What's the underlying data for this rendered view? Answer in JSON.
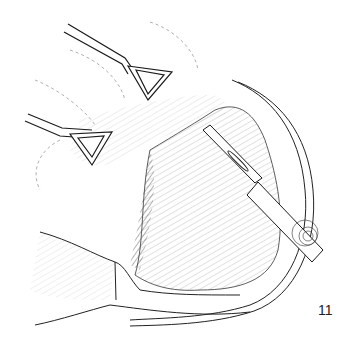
{
  "figure": {
    "number": "11",
    "elements": [
      "retractor-clamp-upper",
      "retractor-clamp-lower",
      "scalpel",
      "tissue-flap",
      "hatched-tissue-region"
    ]
  },
  "colors": {
    "background": "#ffffff",
    "ink": "#1a1a1a",
    "shading": "#555555"
  }
}
